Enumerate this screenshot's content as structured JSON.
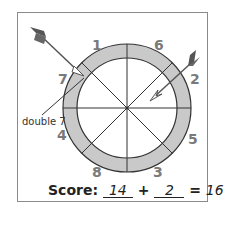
{
  "diagram": {
    "ring_color": "#c9c9c9",
    "line_color": "#333333",
    "arrow_color": "#555555",
    "segments": [
      {
        "label": "1",
        "position": "top-left"
      },
      {
        "label": "6",
        "position": "top-right"
      },
      {
        "label": "2",
        "position": "right-upper"
      },
      {
        "label": "5",
        "position": "right-lower"
      },
      {
        "label": "3",
        "position": "bottom-right"
      },
      {
        "label": "8",
        "position": "bottom-left"
      },
      {
        "label": "4",
        "position": "left-lower"
      },
      {
        "label": "7",
        "position": "left-upper"
      }
    ],
    "annotation": "double 7",
    "darts": [
      {
        "target": "7",
        "ring": "double"
      },
      {
        "target": "2",
        "ring": "single"
      }
    ]
  },
  "score": {
    "label": "Score:",
    "first": "14",
    "plus": "+",
    "second": "2",
    "equals": "=",
    "total": "16"
  }
}
